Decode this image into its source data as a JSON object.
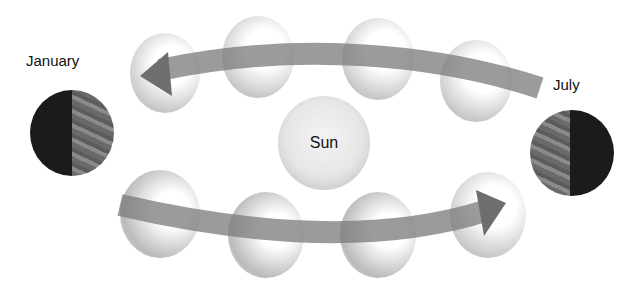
{
  "labels": {
    "january": "January",
    "july": "July",
    "sun": "Sun"
  },
  "colors": {
    "arrow": "#777777",
    "earth_dark": "#1b1b1b",
    "earth_lit": "#777777",
    "sun": "#e6e6e6"
  },
  "diagram": {
    "title_hidden": "Earth's orbit around the Sun showing January and July positions",
    "top_arrow_direction": "right-to-left",
    "bottom_arrow_direction": "left-to-right"
  }
}
